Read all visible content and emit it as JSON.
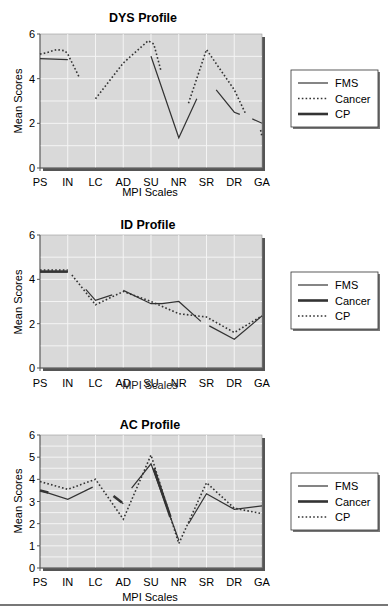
{
  "chart_data": [
    {
      "type": "line",
      "title": "DYS Profile",
      "xlabel": "MPI Scales",
      "ylabel": "Mean Scores",
      "categories": [
        "PS",
        "IN",
        "LC",
        "AD",
        "SU",
        "NR",
        "SR",
        "DR",
        "GA"
      ],
      "ylim": [
        0,
        6
      ],
      "yticks": [
        0,
        2,
        4,
        6
      ],
      "grid": true,
      "legend_position": "right",
      "series": [
        {
          "name": "FMS",
          "style": "thin-solid",
          "values": [
            4.9,
            4.85,
            null,
            null,
            5.0,
            1.35,
            3.5,
            2.5,
            2.0
          ]
        },
        {
          "name": "Cancer",
          "style": "dotted",
          "values": [
            5.1,
            5.25,
            3.1,
            4.7,
            5.6,
            2.9,
            5.3,
            3.0,
            1.4
          ]
        },
        {
          "name": "CP",
          "style": "thick-solid",
          "values": [
            null,
            null,
            null,
            null,
            null,
            null,
            null,
            null,
            null
          ]
        }
      ],
      "visible_segments": {
        "FMS": [
          [
            [
              0,
              4.9
            ],
            [
              1,
              4.85
            ]
          ],
          [
            [
              4,
              5.0
            ],
            [
              5,
              1.35
            ],
            [
              5.65,
              3.1
            ]
          ],
          [
            [
              6.35,
              3.5
            ],
            [
              7,
              2.5
            ],
            [
              7.2,
              2.4
            ]
          ],
          [
            [
              7.65,
              2.2
            ],
            [
              8,
              2.0
            ]
          ]
        ],
        "Cancer": [
          [
            [
              0,
              5.1
            ],
            [
              0.2,
              5.15
            ],
            [
              0.6,
              5.3
            ],
            [
              0.9,
              5.25
            ],
            [
              1,
              5.1
            ],
            [
              1.4,
              4.1
            ]
          ],
          [
            [
              2,
              3.1
            ],
            [
              3,
              4.7
            ],
            [
              3.9,
              5.7
            ],
            [
              4.1,
              5.55
            ],
            [
              4.35,
              4.4
            ]
          ],
          [
            [
              5.35,
              2.9
            ],
            [
              6,
              5.3
            ],
            [
              7,
              3.5
            ],
            [
              7.4,
              2.45
            ]
          ],
          [
            [
              7.95,
              1.7
            ],
            [
              8,
              1.4
            ]
          ]
        ]
      }
    },
    {
      "type": "line",
      "title": "ID Profile",
      "xlabel": "MPI Scales",
      "ylabel": "Mean Scores",
      "categories": [
        "PS",
        "IN",
        "LC",
        "AD",
        "SU",
        "NR",
        "SR",
        "DR",
        "GA"
      ],
      "ylim": [
        0,
        6
      ],
      "yticks": [
        0,
        2,
        4,
        6
      ],
      "grid": true,
      "legend_position": "right",
      "series": [
        {
          "name": "FMS",
          "style": "thin-solid",
          "values": [
            4.35,
            4.35,
            3.05,
            3.5,
            2.9,
            3.0,
            2.1,
            1.3,
            2.35
          ]
        },
        {
          "name": "Cancer",
          "style": "thick-solid",
          "values": [
            4.35,
            4.35,
            null,
            null,
            null,
            null,
            null,
            null,
            null
          ]
        },
        {
          "name": "CP",
          "style": "dotted",
          "values": [
            4.4,
            4.4,
            2.85,
            3.45,
            3.0,
            2.45,
            2.3,
            1.6,
            2.35
          ]
        }
      ],
      "visible_segments": {
        "FMS": [
          [
            [
              0,
              4.35
            ],
            [
              1,
              4.35
            ]
          ],
          [
            [
              1.65,
              3.55
            ],
            [
              2,
              3.05
            ],
            [
              2.6,
              3.3
            ]
          ],
          [
            [
              3,
              3.5
            ],
            [
              4,
              2.9
            ],
            [
              4.4,
              2.9
            ],
            [
              5,
              3.0
            ],
            [
              5.8,
              2.1
            ]
          ],
          [
            [
              6.1,
              1.9
            ],
            [
              7,
              1.3
            ],
            [
              8,
              2.35
            ]
          ]
        ],
        "Cancer": [
          [
            [
              0,
              4.35
            ],
            [
              1,
              4.35
            ]
          ]
        ],
        "CP": [
          [
            [
              0,
              4.42
            ],
            [
              1,
              4.42
            ]
          ],
          [
            [
              1.15,
              4.2
            ],
            [
              2,
              2.85
            ],
            [
              3,
              3.45
            ],
            [
              4,
              3.0
            ],
            [
              5,
              2.45
            ],
            [
              6,
              2.3
            ],
            [
              7,
              1.6
            ],
            [
              8,
              2.35
            ]
          ]
        ]
      }
    },
    {
      "type": "line",
      "title": "AC Profile",
      "xlabel": "MPI Scales",
      "ylabel": "Mean Scores",
      "categories": [
        "PS",
        "IN",
        "LC",
        "AD",
        "SU",
        "NR",
        "SR",
        "DR",
        "GA"
      ],
      "ylim": [
        0,
        6
      ],
      "yticks": [
        0,
        1,
        2,
        3,
        4,
        5,
        6
      ],
      "grid": true,
      "legend_position": "right",
      "series": [
        {
          "name": "FMS",
          "style": "thin-solid",
          "values": [
            3.5,
            3.1,
            3.65,
            2.9,
            4.7,
            1.25,
            3.35,
            2.65,
            2.8
          ]
        },
        {
          "name": "Cancer",
          "style": "thick-solid",
          "values": [
            3.5,
            3.1,
            3.65,
            2.9,
            4.7,
            1.25,
            3.35,
            2.65,
            2.8
          ]
        },
        {
          "name": "CP",
          "style": "dotted",
          "values": [
            3.9,
            3.55,
            4.0,
            2.2,
            5.1,
            1.1,
            3.85,
            2.7,
            2.45
          ]
        }
      ],
      "visible_segments": {
        "FMS": [
          [
            [
              0,
              3.5
            ],
            [
              1,
              3.1
            ],
            [
              1.9,
              3.65
            ]
          ],
          [
            [
              2.7,
              3.2
            ],
            [
              3,
              2.9
            ]
          ],
          [
            [
              3.3,
              3.6
            ],
            [
              4,
              4.7
            ],
            [
              5,
              1.25
            ]
          ],
          [
            [
              5.35,
              2.0
            ],
            [
              6,
              3.35
            ],
            [
              7,
              2.65
            ],
            [
              8,
              2.8
            ]
          ]
        ],
        "Cancer": [
          [
            [
              0,
              3.5
            ],
            [
              0.3,
              3.4
            ]
          ],
          [
            [
              2.65,
              3.25
            ],
            [
              2.95,
              2.95
            ]
          ],
          [
            [
              4.1,
              4.5
            ],
            [
              4.7,
              2.3
            ]
          ]
        ],
        "CP": [
          [
            [
              0,
              3.9
            ],
            [
              1,
              3.55
            ],
            [
              2,
              4.0
            ],
            [
              3,
              2.2
            ],
            [
              4,
              5.1
            ],
            [
              5,
              1.1
            ],
            [
              6,
              3.85
            ],
            [
              7,
              2.7
            ],
            [
              8,
              2.45
            ]
          ]
        ]
      }
    }
  ],
  "charts": [
    {
      "title": "DYS Profile",
      "xlabel": "MPI Scales",
      "ylabel": "Mean Scores",
      "yticks": [
        "0",
        "2",
        "4",
        "6"
      ],
      "xticks": [
        "PS",
        "IN",
        "LC",
        "AD",
        "SU",
        "NR",
        "SR",
        "DR",
        "GA"
      ],
      "legend": [
        {
          "label": "FMS",
          "style": "thin-solid"
        },
        {
          "label": "Cancer",
          "style": "dotted"
        },
        {
          "label": "CP",
          "style": "thick-solid"
        }
      ]
    },
    {
      "title": "ID Profile",
      "xlabel": "MPI Scales",
      "ylabel": "Mean Scores",
      "yticks": [
        "0",
        "2",
        "4",
        "6"
      ],
      "xticks": [
        "PS",
        "IN",
        "LC",
        "AD",
        "SU",
        "NR",
        "SR",
        "DR",
        "GA"
      ],
      "legend": [
        {
          "label": "FMS",
          "style": "thin-solid"
        },
        {
          "label": "Cancer",
          "style": "thick-solid"
        },
        {
          "label": "CP",
          "style": "dotted"
        }
      ]
    },
    {
      "title": "AC Profile",
      "xlabel": "MPI Scales",
      "ylabel": "Mean Scores",
      "yticks": [
        "0",
        "1",
        "2",
        "3",
        "4",
        "5",
        "6"
      ],
      "xticks": [
        "PS",
        "IN",
        "LC",
        "AD",
        "SU",
        "NR",
        "SR",
        "DR",
        "GA"
      ],
      "legend": [
        {
          "label": "FMS",
          "style": "thin-solid"
        },
        {
          "label": "Cancer",
          "style": "thick-solid"
        },
        {
          "label": "CP",
          "style": "dotted"
        }
      ]
    }
  ],
  "colors": {
    "plot_bg": "#d9d9d9",
    "grid": "#f4f4f4",
    "line": "#333333",
    "shadow": "#555555"
  }
}
